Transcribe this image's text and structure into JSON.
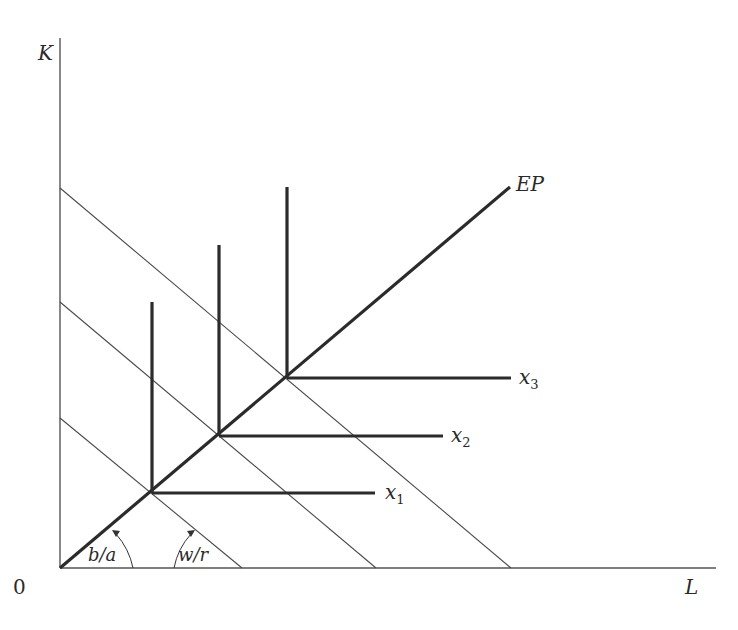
{
  "diagram": {
    "type": "leontief-isoquants-with-isocost-lines",
    "axes": {
      "y_label": "K",
      "x_label": "L",
      "origin_label": "0"
    },
    "expansion_path": {
      "label": "EP"
    },
    "isoquants": [
      {
        "label": "x",
        "subscript": "1"
      },
      {
        "label": "x",
        "subscript": "2"
      },
      {
        "label": "x",
        "subscript": "3"
      }
    ],
    "angle_labels": {
      "expansion_slope": "b/a",
      "isocost_slope": "w/r"
    },
    "colors": {
      "axis": "#555555",
      "thick_lines": "#2b2b2b",
      "thin_lines": "#4a4a4a",
      "text": "#2a2a2a"
    }
  }
}
